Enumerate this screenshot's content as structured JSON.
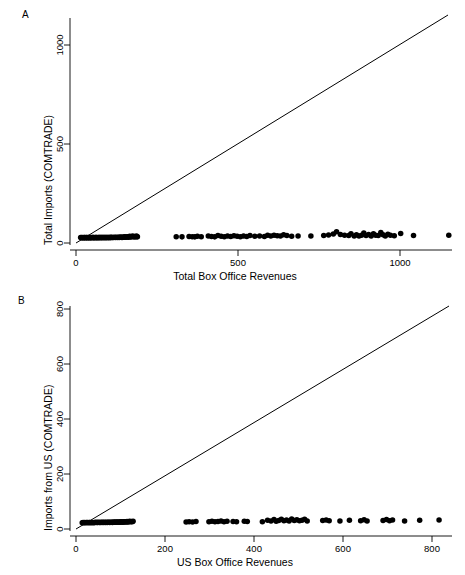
{
  "figure": {
    "background": "#ffffff",
    "ink": "#000000",
    "width": 465,
    "height": 575
  },
  "panels": [
    {
      "letter": "A",
      "name": "panel-a",
      "chart_index": 0
    },
    {
      "letter": "B",
      "name": "panel-b",
      "chart_index": 1
    }
  ],
  "chart_data": [
    {
      "type": "scatter",
      "panel": "A",
      "title": "",
      "xlabel": "Total Box Office Revenues",
      "ylabel": "Total Imports (COMTRADE)",
      "xlim": [
        -30,
        1160
      ],
      "ylim": [
        -45,
        1180
      ],
      "xticks": [
        0,
        500,
        1000
      ],
      "yticks": [
        0,
        500,
        1000
      ],
      "xticklabels": [
        "0",
        "500",
        "1000"
      ],
      "yticklabels": [
        "0",
        "500",
        "1000"
      ],
      "grid": false,
      "legend": null,
      "annotations": [
        {
          "type": "identity-line",
          "label": "45 degree line y = x",
          "from": [
            0,
            0
          ],
          "to": [
            1150,
            1150
          ]
        }
      ],
      "marker": {
        "shape": "circle",
        "color": "#000000",
        "size": 4
      },
      "points": [
        [
          2,
          1
        ],
        [
          5,
          1
        ],
        [
          7,
          0
        ],
        [
          9,
          1
        ],
        [
          11,
          0
        ],
        [
          13,
          1
        ],
        [
          15,
          1
        ],
        [
          17,
          0
        ],
        [
          19,
          1
        ],
        [
          21,
          1
        ],
        [
          23,
          0
        ],
        [
          25,
          1
        ],
        [
          27,
          1
        ],
        [
          29,
          0
        ],
        [
          31,
          1
        ],
        [
          33,
          1
        ],
        [
          35,
          0
        ],
        [
          37,
          1
        ],
        [
          39,
          2
        ],
        [
          41,
          1
        ],
        [
          43,
          1
        ],
        [
          45,
          0
        ],
        [
          47,
          1
        ],
        [
          49,
          2
        ],
        [
          51,
          1
        ],
        [
          53,
          1
        ],
        [
          55,
          0
        ],
        [
          57,
          2
        ],
        [
          59,
          1
        ],
        [
          61,
          1
        ],
        [
          63,
          2
        ],
        [
          65,
          1
        ],
        [
          67,
          1
        ],
        [
          69,
          2
        ],
        [
          71,
          1
        ],
        [
          73,
          2
        ],
        [
          75,
          1
        ],
        [
          77,
          2
        ],
        [
          79,
          1
        ],
        [
          81,
          2
        ],
        [
          83,
          1
        ],
        [
          85,
          2
        ],
        [
          87,
          2
        ],
        [
          89,
          1
        ],
        [
          91,
          2
        ],
        [
          93,
          2
        ],
        [
          95,
          1
        ],
        [
          97,
          3
        ],
        [
          99,
          2
        ],
        [
          101,
          2
        ],
        [
          104,
          2
        ],
        [
          107,
          3
        ],
        [
          110,
          2
        ],
        [
          113,
          3
        ],
        [
          116,
          2
        ],
        [
          119,
          3
        ],
        [
          122,
          2
        ],
        [
          125,
          4
        ],
        [
          128,
          3
        ],
        [
          131,
          2
        ],
        [
          134,
          4
        ],
        [
          137,
          3
        ],
        [
          140,
          5
        ],
        [
          143,
          3
        ],
        [
          146,
          4
        ],
        [
          149,
          6
        ],
        [
          152,
          3
        ],
        [
          155,
          8
        ],
        [
          158,
          4
        ],
        [
          161,
          6
        ],
        [
          164,
          10
        ],
        [
          167,
          5
        ],
        [
          170,
          7
        ],
        [
          173,
          4
        ],
        [
          176,
          9
        ],
        [
          179,
          5
        ],
        [
          300,
          6
        ],
        [
          318,
          5
        ],
        [
          340,
          7
        ],
        [
          350,
          6
        ],
        [
          358,
          5
        ],
        [
          366,
          8
        ],
        [
          378,
          6
        ],
        [
          400,
          9
        ],
        [
          410,
          7
        ],
        [
          420,
          5
        ],
        [
          430,
          12
        ],
        [
          440,
          8
        ],
        [
          450,
          6
        ],
        [
          460,
          9
        ],
        [
          470,
          7
        ],
        [
          480,
          11
        ],
        [
          490,
          8
        ],
        [
          500,
          6
        ],
        [
          510,
          9
        ],
        [
          520,
          7
        ],
        [
          530,
          12
        ],
        [
          545,
          8
        ],
        [
          560,
          10
        ],
        [
          575,
          7
        ],
        [
          585,
          13
        ],
        [
          595,
          9
        ],
        [
          605,
          14
        ],
        [
          615,
          11
        ],
        [
          625,
          9
        ],
        [
          635,
          16
        ],
        [
          645,
          12
        ],
        [
          660,
          8
        ],
        [
          680,
          10
        ],
        [
          720,
          9
        ],
        [
          760,
          12
        ],
        [
          775,
          15
        ],
        [
          790,
          20
        ],
        [
          800,
          32
        ],
        [
          812,
          18
        ],
        [
          825,
          14
        ],
        [
          838,
          12
        ],
        [
          845,
          22
        ],
        [
          855,
          10
        ],
        [
          862,
          16
        ],
        [
          870,
          9
        ],
        [
          878,
          14
        ],
        [
          885,
          25
        ],
        [
          892,
          12
        ],
        [
          900,
          18
        ],
        [
          908,
          10
        ],
        [
          915,
          21
        ],
        [
          922,
          14
        ],
        [
          930,
          12
        ],
        [
          938,
          28
        ],
        [
          945,
          16
        ],
        [
          952,
          10
        ],
        [
          960,
          19
        ],
        [
          968,
          13
        ],
        [
          980,
          11
        ],
        [
          1000,
          23
        ],
        [
          1040,
          12
        ],
        [
          1150,
          14
        ]
      ]
    },
    {
      "type": "scatter",
      "panel": "B",
      "title": "",
      "xlabel": "US Box Office Revenues",
      "ylabel": "Imports from US (COMTRADE)",
      "xlim": [
        -25,
        860
      ],
      "ylim": [
        -35,
        880
      ],
      "xticks": [
        0,
        200,
        400,
        600,
        800
      ],
      "yticks": [
        0,
        200,
        400,
        600,
        800
      ],
      "xticklabels": [
        "0",
        "200",
        "400",
        "600",
        "800"
      ],
      "yticklabels": [
        "0",
        "200",
        "400",
        "600",
        "800"
      ],
      "grid": false,
      "legend": null,
      "annotations": [
        {
          "type": "identity-line",
          "label": "45 degree line y = x",
          "from": [
            0,
            0
          ],
          "to": [
            840,
            840
          ]
        }
      ],
      "marker": {
        "shape": "circle",
        "color": "#000000",
        "size": 4
      },
      "points": [
        [
          2,
          0
        ],
        [
          4,
          1
        ],
        [
          6,
          0
        ],
        [
          8,
          1
        ],
        [
          10,
          0
        ],
        [
          12,
          1
        ],
        [
          14,
          1
        ],
        [
          16,
          0
        ],
        [
          18,
          1
        ],
        [
          20,
          1
        ],
        [
          22,
          0
        ],
        [
          24,
          1
        ],
        [
          26,
          1
        ],
        [
          28,
          0
        ],
        [
          30,
          1
        ],
        [
          32,
          1
        ],
        [
          34,
          2
        ],
        [
          36,
          1
        ],
        [
          38,
          1
        ],
        [
          40,
          2
        ],
        [
          42,
          1
        ],
        [
          44,
          1
        ],
        [
          46,
          2
        ],
        [
          48,
          1
        ],
        [
          50,
          2
        ],
        [
          52,
          1
        ],
        [
          54,
          2
        ],
        [
          56,
          1
        ],
        [
          58,
          2
        ],
        [
          60,
          1
        ],
        [
          62,
          2
        ],
        [
          64,
          2
        ],
        [
          66,
          1
        ],
        [
          68,
          2
        ],
        [
          70,
          2
        ],
        [
          72,
          1
        ],
        [
          74,
          3
        ],
        [
          76,
          2
        ],
        [
          78,
          2
        ],
        [
          80,
          3
        ],
        [
          82,
          2
        ],
        [
          84,
          3
        ],
        [
          86,
          2
        ],
        [
          88,
          3
        ],
        [
          90,
          2
        ],
        [
          92,
          4
        ],
        [
          94,
          3
        ],
        [
          96,
          2
        ],
        [
          98,
          4
        ],
        [
          100,
          3
        ],
        [
          102,
          4
        ],
        [
          104,
          3
        ],
        [
          106,
          5
        ],
        [
          108,
          3
        ],
        [
          110,
          4
        ],
        [
          112,
          6
        ],
        [
          114,
          4
        ],
        [
          116,
          5
        ],
        [
          118,
          4
        ],
        [
          120,
          6
        ],
        [
          243,
          3
        ],
        [
          250,
          4
        ],
        [
          258,
          3
        ],
        [
          266,
          5
        ],
        [
          296,
          4
        ],
        [
          303,
          6
        ],
        [
          310,
          4
        ],
        [
          317,
          5
        ],
        [
          324,
          7
        ],
        [
          331,
          4
        ],
        [
          338,
          6
        ],
        [
          352,
          5
        ],
        [
          360,
          4
        ],
        [
          378,
          6
        ],
        [
          385,
          5
        ],
        [
          420,
          4
        ],
        [
          432,
          10
        ],
        [
          440,
          7
        ],
        [
          447,
          13
        ],
        [
          452,
          6
        ],
        [
          458,
          9
        ],
        [
          464,
          14
        ],
        [
          470,
          8
        ],
        [
          476,
          11
        ],
        [
          482,
          7
        ],
        [
          488,
          15
        ],
        [
          494,
          9
        ],
        [
          500,
          12
        ],
        [
          506,
          8
        ],
        [
          512,
          10
        ],
        [
          518,
          14
        ],
        [
          524,
          7
        ],
        [
          560,
          9
        ],
        [
          568,
          11
        ],
        [
          575,
          8
        ],
        [
          600,
          7
        ],
        [
          622,
          10
        ],
        [
          648,
          8
        ],
        [
          656,
          12
        ],
        [
          663,
          7
        ],
        [
          700,
          9
        ],
        [
          708,
          13
        ],
        [
          715,
          8
        ],
        [
          722,
          11
        ],
        [
          750,
          7
        ],
        [
          785,
          10
        ],
        [
          830,
          11
        ]
      ]
    }
  ]
}
